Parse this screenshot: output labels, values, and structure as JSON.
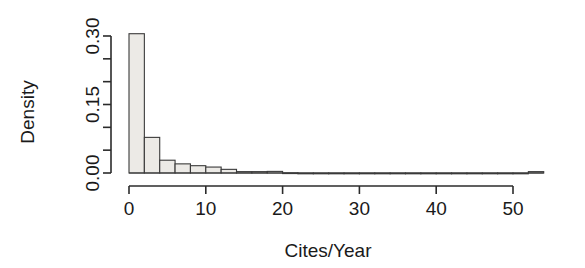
{
  "chart_data": {
    "type": "bar",
    "subtype": "histogram",
    "title": "",
    "xlabel": "Cites/Year",
    "ylabel": "Density",
    "xlim": [
      -0.5,
      54.5
    ],
    "ylim": [
      0.0,
      0.315
    ],
    "grid": false,
    "legend": null,
    "bin_width": 2,
    "x_ticks": [
      0,
      10,
      20,
      30,
      40,
      50
    ],
    "x_tick_labels": [
      "0",
      "10",
      "20",
      "30",
      "40",
      "50"
    ],
    "y_ticks": [
      0.0,
      0.05,
      0.1,
      0.15,
      0.2,
      0.25,
      0.3
    ],
    "y_tick_labels": [
      "0.00",
      "",
      "",
      "0.15",
      "",
      "",
      "0.30"
    ],
    "y_major_tick_labels": [
      "0.00",
      "0.15",
      "0.30"
    ],
    "bin_edges": [
      0,
      2,
      4,
      6,
      8,
      10,
      12,
      14,
      16,
      18,
      20,
      22,
      24,
      26,
      28,
      30,
      32,
      34,
      36,
      38,
      40,
      42,
      44,
      46,
      48,
      50,
      52,
      54
    ],
    "values": [
      0.305,
      0.078,
      0.028,
      0.02,
      0.016,
      0.013,
      0.008,
      0.003,
      0.003,
      0.0035,
      0.0005,
      0.0,
      0.0,
      0.0,
      0.0,
      0.0,
      0.0,
      0.0,
      0.0,
      0.0,
      0.0,
      0.0,
      0.0,
      0.0,
      0.0,
      0.0,
      0.003
    ],
    "bar_fill_color": "#eceae6",
    "bar_edge_color": "#3a3a3a",
    "axis_color": "#2b2b2b",
    "background_color": "#ffffff"
  },
  "labels": {
    "y_axis_title": "Density",
    "x_axis_title": "Cites/Year"
  }
}
